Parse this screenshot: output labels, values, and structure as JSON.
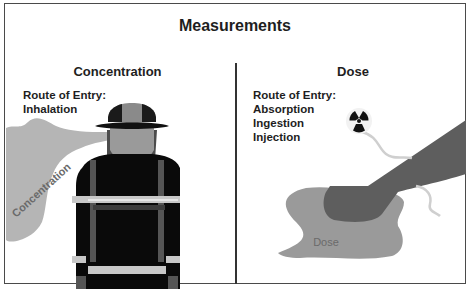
{
  "title": "Measurements",
  "left_panel": {
    "heading": "Concentration",
    "route_label": "Route of Entry:",
    "routes": [
      "Inhalation"
    ],
    "cloud_label": "Concentration"
  },
  "right_panel": {
    "heading": "Dose",
    "route_label": "Route of Entry:",
    "routes": [
      "Absorption",
      "Ingestion",
      "Injection"
    ],
    "puddle_label": "Dose"
  },
  "colors": {
    "border": "#4a4a4a",
    "cloud": "#b5b5b5",
    "puddle": "#9a9a9a",
    "arm": "#5e5e5e",
    "suit": "#0a0a0a",
    "reflective": "#c8c8c8",
    "helmet": "#8a8a8a"
  }
}
